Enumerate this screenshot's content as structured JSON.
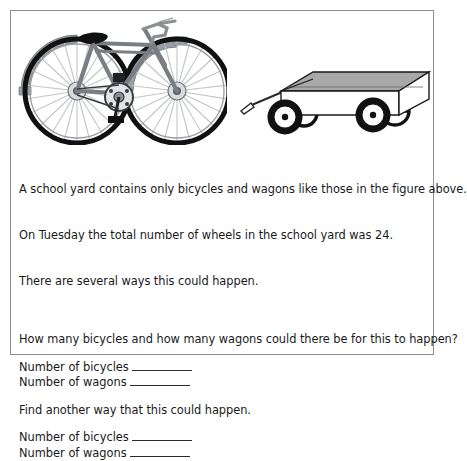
{
  "worksheet": {
    "figure": {
      "bicycle": {
        "label": "bicycle-illustration",
        "alt": "side view of a bicycle with two wheels",
        "wheel_count": 2,
        "colors": {
          "tire": "#111111",
          "frame": "#7a7d82",
          "spoke": "#b9bcc1",
          "fender": "#9a9da2",
          "saddle": "#111111"
        }
      },
      "wagon": {
        "label": "wagon-illustration",
        "alt": "side view of a four wheeled wagon with a pull handle",
        "wheel_count": 4,
        "colors": {
          "tire": "#111111",
          "body": "#ffffff",
          "panel_shade": "#a8a8a8",
          "outline": "#1a1a1a"
        }
      }
    },
    "body": {
      "intro": [
        "A school yard contains only bicycles and wagons like those in the figure above.",
        "On Tuesday the total number of wheels in the school yard was 24.",
        "There are several ways this could happen."
      ],
      "question": "How many bicycles and how many wagons could there be for this to happen?",
      "answer_group_1": {
        "bicycles_label": "Number of bicycles",
        "bicycles_value": "",
        "wagons_label": "Number of wagons",
        "wagons_value": ""
      },
      "followup": "Find another way that this could happen.",
      "answer_group_2": {
        "bicycles_label": "Number of bicycles",
        "bicycles_value": "",
        "wagons_label": "Number of wagons",
        "wagons_value": ""
      }
    }
  }
}
